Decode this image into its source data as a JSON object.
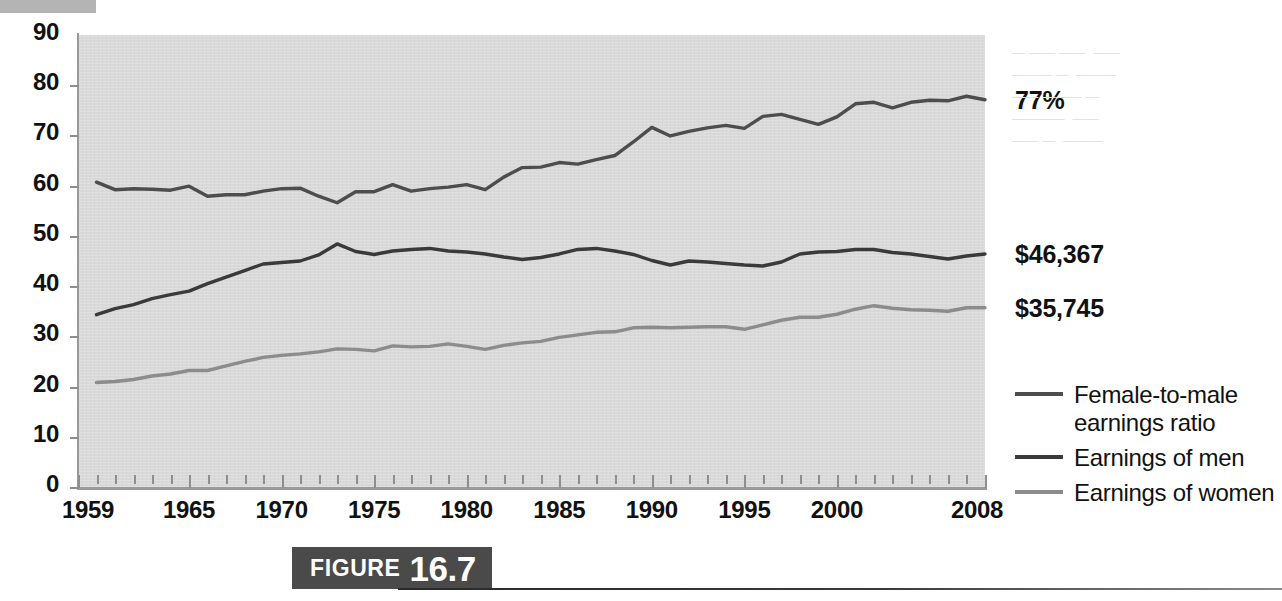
{
  "figure": {
    "badge_word": "FIGURE",
    "badge_number": "16.7"
  },
  "chart_data": {
    "type": "line",
    "title": "",
    "subtitle": "",
    "xlabel": "",
    "ylabel": "",
    "xlim": [
      1959,
      2008
    ],
    "ylim": [
      0,
      90
    ],
    "grid": false,
    "legend_position": "right",
    "y_ticks": [
      90,
      80,
      70,
      60,
      50,
      40,
      30,
      20,
      10,
      0
    ],
    "x_tick_labels": [
      "1959",
      "1965",
      "1970",
      "1975",
      "1980",
      "1985",
      "1990",
      "1995",
      "2000",
      "2008"
    ],
    "x_tick_values": [
      1959,
      1965,
      1970,
      1975,
      1980,
      1985,
      1990,
      1995,
      2000,
      2008
    ],
    "x": [
      1960,
      1961,
      1962,
      1963,
      1964,
      1965,
      1966,
      1967,
      1968,
      1969,
      1970,
      1971,
      1972,
      1973,
      1974,
      1975,
      1976,
      1977,
      1978,
      1979,
      1980,
      1981,
      1982,
      1983,
      1984,
      1985,
      1986,
      1987,
      1988,
      1989,
      1990,
      1991,
      1992,
      1993,
      1994,
      1995,
      1996,
      1997,
      1998,
      1999,
      2000,
      2001,
      2002,
      2003,
      2004,
      2005,
      2006,
      2007,
      2008
    ],
    "series": [
      {
        "name": "Female-to-male earnings ratio",
        "color": "#4d4d4d",
        "unit": "percent",
        "end_label": "77%",
        "values": [
          60.7,
          59.2,
          59.4,
          59.3,
          59.1,
          59.9,
          57.9,
          58.2,
          58.2,
          58.9,
          59.4,
          59.5,
          57.9,
          56.6,
          58.8,
          58.8,
          60.2,
          58.9,
          59.4,
          59.7,
          60.2,
          59.2,
          61.7,
          63.6,
          63.7,
          64.6,
          64.3,
          65.2,
          66.0,
          68.7,
          71.6,
          69.9,
          70.8,
          71.5,
          72.0,
          71.4,
          73.8,
          74.2,
          73.2,
          72.2,
          73.7,
          76.3,
          76.6,
          75.5,
          76.6,
          77.0,
          76.9,
          77.8,
          77.1
        ]
      },
      {
        "name": "Earnings of men",
        "color": "#3a3a3a",
        "unit": "thousands of 2008 dollars",
        "end_label": "$46,367",
        "values": [
          34.3,
          35.5,
          36.3,
          37.5,
          38.3,
          39.0,
          40.5,
          41.8,
          43.1,
          44.4,
          44.7,
          45.0,
          46.2,
          48.4,
          46.9,
          46.3,
          47.0,
          47.3,
          47.5,
          47.0,
          46.8,
          46.4,
          45.8,
          45.3,
          45.7,
          46.4,
          47.3,
          47.5,
          47.0,
          46.3,
          45.1,
          44.2,
          45.0,
          44.8,
          44.5,
          44.2,
          44.0,
          44.8,
          46.4,
          46.8,
          46.9,
          47.3,
          47.3,
          46.7,
          46.4,
          45.9,
          45.4,
          46.0,
          46.4
        ]
      },
      {
        "name": "Earnings of women",
        "color": "#8c8c8c",
        "unit": "thousands of 2008 dollars",
        "end_label": "$35,745",
        "values": [
          20.8,
          21.0,
          21.4,
          22.1,
          22.5,
          23.2,
          23.2,
          24.1,
          25.0,
          25.8,
          26.2,
          26.5,
          26.9,
          27.5,
          27.4,
          27.1,
          28.1,
          27.9,
          28.0,
          28.5,
          28.0,
          27.4,
          28.2,
          28.7,
          29.0,
          29.8,
          30.3,
          30.8,
          30.9,
          31.7,
          31.8,
          31.7,
          31.8,
          31.9,
          31.9,
          31.4,
          32.3,
          33.2,
          33.8,
          33.8,
          34.4,
          35.4,
          36.1,
          35.6,
          35.3,
          35.2,
          35.0,
          35.7,
          35.7
        ]
      }
    ],
    "annotations": [
      {
        "text": "77%",
        "series": "Female-to-male earnings ratio",
        "at_x": 2008
      },
      {
        "text": "$46,367",
        "series": "Earnings of men",
        "at_x": 2008
      },
      {
        "text": "$35,745",
        "series": "Earnings of women",
        "at_x": 2008
      }
    ]
  },
  "ghost_text": {
    "right_lines": [
      "— —— ——  ——",
      "——— —  ———",
      "—— ——— —",
      "————  ——",
      "—— —  ———"
    ]
  }
}
